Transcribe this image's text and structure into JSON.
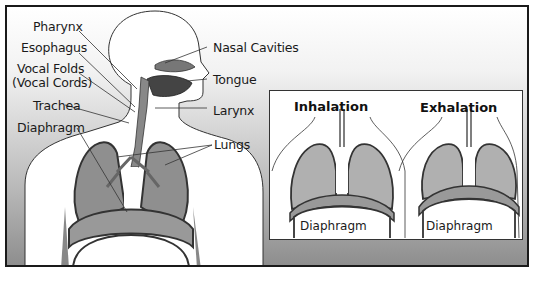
{
  "figure": {
    "type": "respiratory-system-diagram",
    "main_labels": {
      "pharynx": "Pharynx",
      "esophagus": "Esophagus",
      "vocal_folds": "Vocal Folds",
      "vocal_cords": "(Vocal Cords)",
      "trachea": "Trachea",
      "diaphragm": "Diaphragm",
      "nasal_cavities": "Nasal Cavities",
      "tongue": "Tongue",
      "larynx": "Larynx",
      "lungs": "Lungs"
    },
    "inset": {
      "inhalation": {
        "title": "Inhalation",
        "label": "Diaphragm"
      },
      "exhalation": {
        "title": "Exhalation",
        "label": "Diaphragm"
      }
    }
  },
  "colors": {
    "lung": "#8f8f8f",
    "outline": "#333333",
    "background_dark": "#8e8e8e"
  }
}
